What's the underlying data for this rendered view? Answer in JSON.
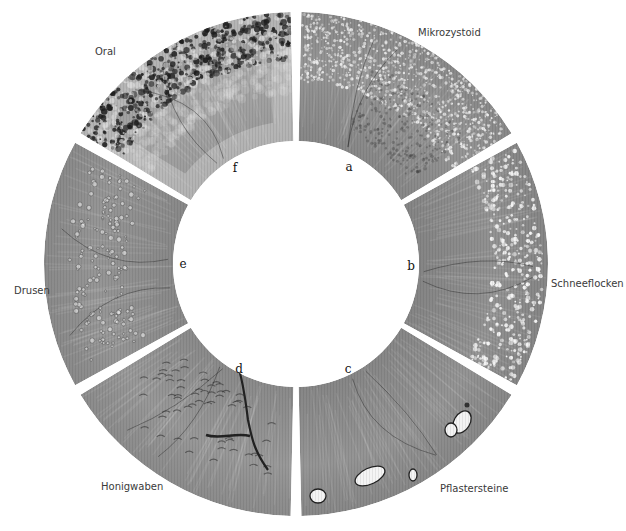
{
  "figure": {
    "center": [
      296,
      264
    ],
    "outer_radius": 252,
    "inner_radius": 123,
    "gap_width": 8,
    "background": "#ffffff",
    "segments": [
      {
        "id": "a",
        "letter": "a",
        "label": "Mikrozystoid",
        "start_deg": 30,
        "end_deg": 90,
        "base_color": "#8f8f8f",
        "texture": "microcysts",
        "letter_pos": [
          349,
          167
        ],
        "label_pos": [
          418,
          27
        ]
      },
      {
        "id": "b",
        "letter": "b",
        "label": "Schneeflocken",
        "start_deg": -30,
        "end_deg": 30,
        "base_color": "#8c8c8c",
        "texture": "snowflakes",
        "letter_pos": [
          411,
          266
        ],
        "label_pos": [
          551,
          278
        ]
      },
      {
        "id": "c",
        "letter": "c",
        "label": "Pflastersteine",
        "start_deg": -90,
        "end_deg": -30,
        "base_color": "#8e8e8e",
        "texture": "paving-stones",
        "letter_pos": [
          348,
          369
        ],
        "label_pos": [
          440,
          483
        ]
      },
      {
        "id": "d",
        "letter": "d",
        "label": "Honigwaben",
        "start_deg": -150,
        "end_deg": -90,
        "base_color": "#929292",
        "texture": "honeycomb",
        "letter_pos": [
          239,
          369
        ],
        "label_pos": [
          101,
          481
        ]
      },
      {
        "id": "e",
        "letter": "e",
        "label": "Drusen",
        "start_deg": 150,
        "end_deg": 210,
        "base_color": "#909090",
        "texture": "drusen",
        "letter_pos": [
          183,
          264
        ],
        "label_pos": [
          14,
          285
        ]
      },
      {
        "id": "f",
        "letter": "f",
        "label": "Oral",
        "start_deg": 90,
        "end_deg": 150,
        "base_color": "#a2a2a2",
        "texture": "oral-pigment",
        "letter_pos": [
          235,
          168
        ],
        "label_pos": [
          95,
          46
        ]
      }
    ]
  }
}
